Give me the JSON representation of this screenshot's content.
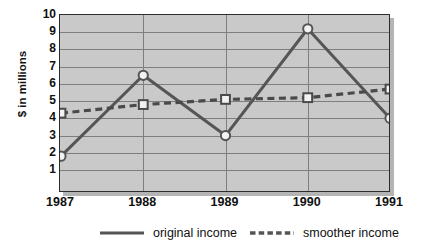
{
  "chart_data": {
    "type": "line",
    "title": "",
    "xlabel": "",
    "ylabel": "$ in millions",
    "categories": [
      "1987",
      "1988",
      "1989",
      "1990",
      "1991"
    ],
    "x": [
      1987,
      1988,
      1989,
      1990,
      1991
    ],
    "ylim": [
      0,
      10
    ],
    "yticks": [
      10,
      9,
      8,
      7,
      6,
      5,
      4,
      3,
      2,
      1
    ],
    "grid": "horizontal-and-vertical",
    "legend_position": "bottom",
    "series": [
      {
        "name": "original income",
        "style": "solid",
        "marker": "circle",
        "color": "#555555",
        "values": [
          1.8,
          6.5,
          3.0,
          9.2,
          4.0
        ]
      },
      {
        "name": "smoother income",
        "style": "dashed",
        "marker": "square",
        "color": "#4a4a4a",
        "values": [
          4.3,
          4.8,
          5.1,
          5.2,
          5.7
        ]
      }
    ]
  },
  "axis": {
    "y_title": "$ in millions",
    "y_tick_labels": [
      "10",
      "9",
      "8",
      "7",
      "6",
      "5",
      "4",
      "3",
      "2",
      "1"
    ],
    "x_tick_labels": [
      "1987",
      "1988",
      "1989",
      "1990",
      "1991"
    ]
  },
  "legend": {
    "items": [
      {
        "label": "original income",
        "style": "solid"
      },
      {
        "label": "smoother income",
        "style": "dashed"
      }
    ]
  },
  "colors": {
    "plot_background": "#c9c9c9",
    "gridline": "#7e7e7e",
    "frame": "#2c2c2c",
    "shadow": "#b4b4b4",
    "series_original": "#555555",
    "series_smoother": "#4a4a4a",
    "text": "#111111",
    "page_background": "#ffffff"
  }
}
